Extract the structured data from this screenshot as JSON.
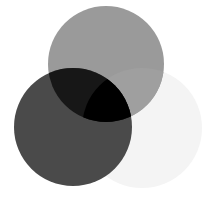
{
  "diagram": {
    "type": "venn",
    "circles": [
      {
        "name": "top",
        "cx": 106,
        "cy": 64,
        "r": 58,
        "color": "#9a9a9a"
      },
      {
        "name": "bottom-left",
        "cx": 73,
        "cy": 127,
        "r": 59,
        "color": "#4a4a4a"
      },
      {
        "name": "bottom-right",
        "cx": 142,
        "cy": 128,
        "r": 60,
        "color": "#f4f4f4"
      }
    ],
    "overlaps": {
      "top_bottom-left": "#171717",
      "top_bottom-right": "#9f9f9f",
      "bottom-left_bottom-right": "#4a4a4a",
      "all": "#000000"
    }
  }
}
